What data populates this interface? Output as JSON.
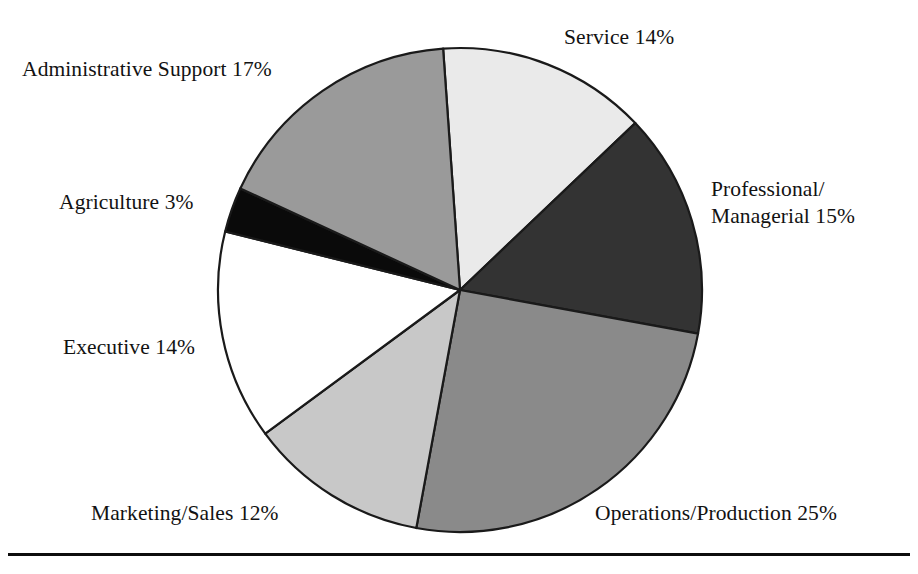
{
  "chart_data": {
    "type": "pie",
    "title": "",
    "subtitle": "",
    "xlabel": "",
    "ylabel": "",
    "legend_position": "none",
    "grid": false,
    "units": "percent",
    "total": 100,
    "start_angle_deg": -4,
    "direction": "clockwise",
    "center": {
      "x": 460,
      "y": 290
    },
    "radius": 242,
    "categories": [
      "Service",
      "Professional/ Managerial",
      "Operations/Production",
      "Marketing/Sales",
      "Executive",
      "Agriculture",
      "Administrative Support"
    ],
    "values": [
      14,
      15,
      25,
      12,
      14,
      3,
      17
    ],
    "slices": [
      {
        "key": "service",
        "name": "Service",
        "value": 14,
        "value_text": "14%",
        "label": "Service 14%",
        "color": "#eaeaea",
        "stroke": "#1a1a1a",
        "start_deg": -4,
        "end_deg": 46.4
      },
      {
        "key": "professional-managerial",
        "name": "Professional/ Managerial",
        "value": 15,
        "value_text": "15%",
        "label_line1": "Professional/",
        "label_line2": "Managerial 15%",
        "color": "#333333",
        "stroke": "#1a1a1a",
        "start_deg": 46.4,
        "end_deg": 100.4
      },
      {
        "key": "operations-production",
        "name": "Operations/Production",
        "value": 25,
        "value_text": "25%",
        "label": "Operations/Production 25%",
        "color": "#8a8a8a",
        "stroke": "#1a1a1a",
        "start_deg": 100.4,
        "end_deg": 190.4
      },
      {
        "key": "marketing-sales",
        "name": "Marketing/Sales",
        "value": 12,
        "value_text": "12%",
        "label": "Marketing/Sales 12%",
        "color": "#c8c8c8",
        "stroke": "#1a1a1a",
        "start_deg": 190.4,
        "end_deg": 233.6
      },
      {
        "key": "executive",
        "name": "Executive",
        "value": 14,
        "value_text": "14%",
        "label": "Executive 14%",
        "color": "#ffffff",
        "stroke": "#1a1a1a",
        "start_deg": 233.6,
        "end_deg": 284.0
      },
      {
        "key": "agriculture",
        "name": "Agriculture",
        "value": 3,
        "value_text": "3%",
        "label": "Agriculture 3%",
        "color": "#0a0a0a",
        "stroke": "#0a0a0a",
        "start_deg": 284.0,
        "end_deg": 294.8
      },
      {
        "key": "administrative-support",
        "name": "Administrative Support",
        "value": 17,
        "value_text": "17%",
        "label": "Administrative Support 17%",
        "color": "#9a9a9a",
        "stroke": "#1a1a1a",
        "start_deg": 294.8,
        "end_deg": 356.0
      }
    ]
  },
  "labels": {
    "administrative_support": "Administrative Support 17%",
    "service": "Service 14%",
    "professional_line1": "Professional/",
    "professional_line2": "Managerial 15%",
    "agriculture": "Agriculture 3%",
    "executive": "Executive 14%",
    "marketing_sales": "Marketing/Sales 12%",
    "operations_production": "Operations/Production 25%"
  },
  "figure": {
    "background_color": "#ffffff",
    "text_color": "#121212",
    "rule_color": "#0d0d0d"
  }
}
